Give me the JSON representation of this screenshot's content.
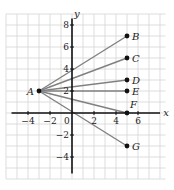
{
  "figure": {
    "origin_label": "0",
    "x_axis_label": "x",
    "y_axis_label": "y",
    "x_ticks": [
      {
        "value": -4,
        "label": "−4"
      },
      {
        "value": -2,
        "label": "−2"
      },
      {
        "value": 2,
        "label": "2"
      },
      {
        "value": 4,
        "label": "4"
      },
      {
        "value": 6,
        "label": "6"
      }
    ],
    "y_ticks": [
      {
        "value": 8,
        "label": "8"
      },
      {
        "value": 6,
        "label": "6"
      },
      {
        "value": 4,
        "label": "4"
      },
      {
        "value": 2,
        "label": "2"
      },
      {
        "value": -2,
        "label": "−2"
      },
      {
        "value": -4,
        "label": "−4"
      }
    ],
    "grid": {
      "x_min": -6,
      "x_max": 8.5,
      "y_min": -6,
      "y_max": 9,
      "step": 1
    },
    "points": [
      {
        "name": "A",
        "x": -3,
        "y": 2,
        "label_side": "left"
      },
      {
        "name": "B",
        "x": 5,
        "y": 7,
        "label_side": "right"
      },
      {
        "name": "C",
        "x": 5,
        "y": 5,
        "label_side": "right"
      },
      {
        "name": "D",
        "x": 5,
        "y": 3,
        "label_side": "right"
      },
      {
        "name": "E",
        "x": 5,
        "y": 2,
        "label_side": "right"
      },
      {
        "name": "F",
        "x": 5,
        "y": 0,
        "label_side": "above-right"
      },
      {
        "name": "G",
        "x": 5,
        "y": -3,
        "label_side": "right"
      }
    ],
    "segments": [
      {
        "from": "A",
        "to": "B"
      },
      {
        "from": "A",
        "to": "C"
      },
      {
        "from": "A",
        "to": "D"
      },
      {
        "from": "A",
        "to": "E"
      },
      {
        "from": "A",
        "to": "F"
      },
      {
        "from": "A",
        "to": "G"
      }
    ],
    "colors": {
      "grid": "#d4d4d4",
      "axis": "#111111",
      "segment": "#808080",
      "point": "#111111",
      "text": "#222222"
    }
  }
}
